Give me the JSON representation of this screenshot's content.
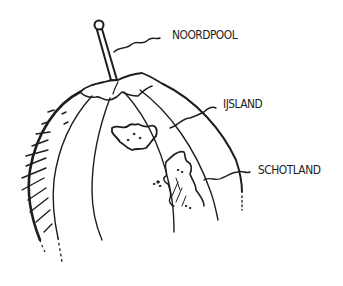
{
  "diagram": {
    "stroke_color": "#1e1e1e",
    "background": "#ffffff",
    "labels": [
      {
        "id": "noordpool",
        "text": "NOORDPOOL"
      },
      {
        "id": "ijsland",
        "text": "IJSLAND"
      },
      {
        "id": "schotland",
        "text": "SCHOTLAND"
      }
    ]
  }
}
